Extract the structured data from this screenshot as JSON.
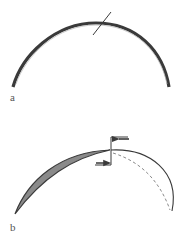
{
  "panels": [
    {
      "id": "a",
      "label": "a",
      "description": "Intact arc (thick band) with a transverse cut line"
    },
    {
      "id": "b",
      "label": "b",
      "description": "Arc cut at the apex; left portion shown as shaded crescent, right portion as solid and dashed arcs, with opposing displacement arrows at the cut"
    }
  ],
  "colors": {
    "stroke": "#3a3a3a",
    "fill_shaded": "#8a8a8a",
    "dashed": "#8a8a8a",
    "background": "#ffffff"
  }
}
